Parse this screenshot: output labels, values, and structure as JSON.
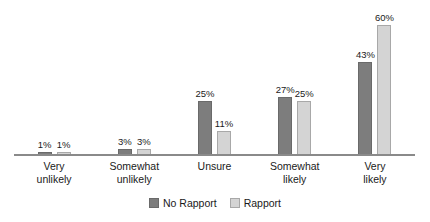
{
  "chart_data": {
    "type": "bar",
    "title": "",
    "subtitle": "",
    "xlabel": "",
    "ylabel": "",
    "ylim": [
      0,
      60
    ],
    "grid": false,
    "legend_position": "bottom-center",
    "value_suffix": "%",
    "categories": [
      "Very unlikely",
      "Somewhat unlikely",
      "Unsure",
      "Somewhat likely",
      "Very likely"
    ],
    "category_lines": [
      [
        "Very",
        "unlikely"
      ],
      [
        "Somewhat",
        "unlikely"
      ],
      [
        "Unsure",
        ""
      ],
      [
        "Somewhat",
        "likely"
      ],
      [
        "Very",
        "likely"
      ]
    ],
    "series": [
      {
        "name": "No Rapport",
        "color": "#7d7d7d",
        "values": [
          1,
          3,
          25,
          27,
          43
        ],
        "labels": [
          "1%",
          "3%",
          "25%",
          "27%",
          "43%"
        ]
      },
      {
        "name": "Rapport",
        "color": "#d4d4d4",
        "values": [
          1,
          3,
          11,
          25,
          60
        ],
        "labels": [
          "1%",
          "3%",
          "11%",
          "25%",
          "60%"
        ]
      }
    ],
    "axis_color": "#8a8a8a"
  },
  "legend": {
    "items": [
      {
        "label": "No Rapport",
        "swatch": "#7d7d7d"
      },
      {
        "label": "Rapport",
        "swatch": "#d4d4d4"
      }
    ]
  }
}
